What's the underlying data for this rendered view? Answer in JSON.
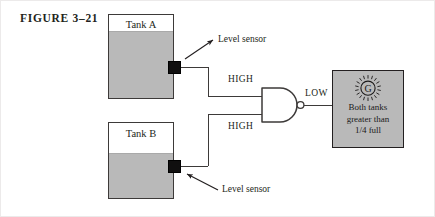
{
  "figure": {
    "caption": "FIGURE 3–21",
    "width": 435,
    "height": 217
  },
  "colors": {
    "liquid_fill": "#b9b9b9",
    "outline": "#3d3a39",
    "sensor": "#100f0f",
    "lamp_box_fill": "#b9b9b9",
    "lamp_box_border": "#231f20",
    "text": "#231f20",
    "page_background": "#ffffff"
  },
  "tanks": [
    {
      "id": "tank-a",
      "label": "Tank A",
      "fill_level_fraction": 0.78,
      "sensor_label": "Level sensor",
      "output_signal": "HIGH"
    },
    {
      "id": "tank-b",
      "label": "Tank B",
      "fill_level_fraction": 0.57,
      "sensor_label": "Level sensor",
      "output_signal": "HIGH"
    }
  ],
  "signals": {
    "tank_a_output": "HIGH",
    "tank_b_output": "HIGH",
    "gate_output": "LOW"
  },
  "gate": {
    "type": "NAND",
    "inputs": 2,
    "has_output_bubble": true,
    "output_label": "LOW"
  },
  "indicator": {
    "glyph": "G",
    "icon_name": "lamp-icon",
    "lines": [
      "Both tanks",
      "greater than",
      "1/4 full"
    ]
  },
  "callouts": [
    {
      "id": "callout-a",
      "text": "Level sensor",
      "points_to": "tank-a-sensor"
    },
    {
      "id": "callout-b",
      "text": "Level sensor",
      "points_to": "tank-b-sensor"
    }
  ]
}
